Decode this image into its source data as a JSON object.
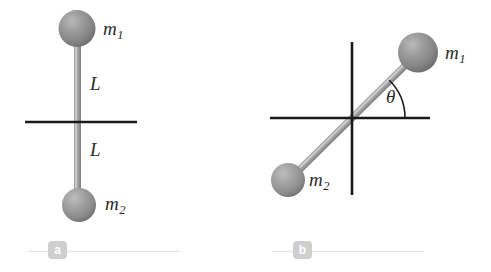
{
  "figure": {
    "background_color": "#ffffff",
    "width": 491,
    "height": 272,
    "sphere_color": "#8e8e8e",
    "sphere_highlight_color": "#b4b4b4",
    "sphere_shadow_color": "#6d6d6d",
    "rod_color": "#9a9a9a",
    "rod_highlight_color": "#d6d6d6",
    "axis_color": "#1a1a1a",
    "label_color": "#2b2b2b",
    "badge_color": "#cfcfcf",
    "rule_color": "#e2e2e2"
  },
  "panel_a": {
    "badge": "a",
    "mass_top": {
      "base": "m",
      "sub": "1"
    },
    "mass_bottom": {
      "base": "m",
      "sub": "2"
    },
    "length_upper": "L",
    "length_lower": "L",
    "description": "Rigid rod of total length 2L lying vertically, with mass m1 at the top end and mass m2 at the bottom end, bisected by a horizontal rotation axis at the midpoint."
  },
  "panel_b": {
    "badge": "b",
    "mass_upper": {
      "base": "m",
      "sub": "1"
    },
    "mass_lower": {
      "base": "m",
      "sub": "2"
    },
    "angle": "θ",
    "angle_degrees": 37,
    "description": "The same rod rotated by angle theta from the horizontal axis, shown with horizontal and vertical axes crossing at the rod midpoint; m1 is up and to the right, m2 is down and to the left."
  }
}
